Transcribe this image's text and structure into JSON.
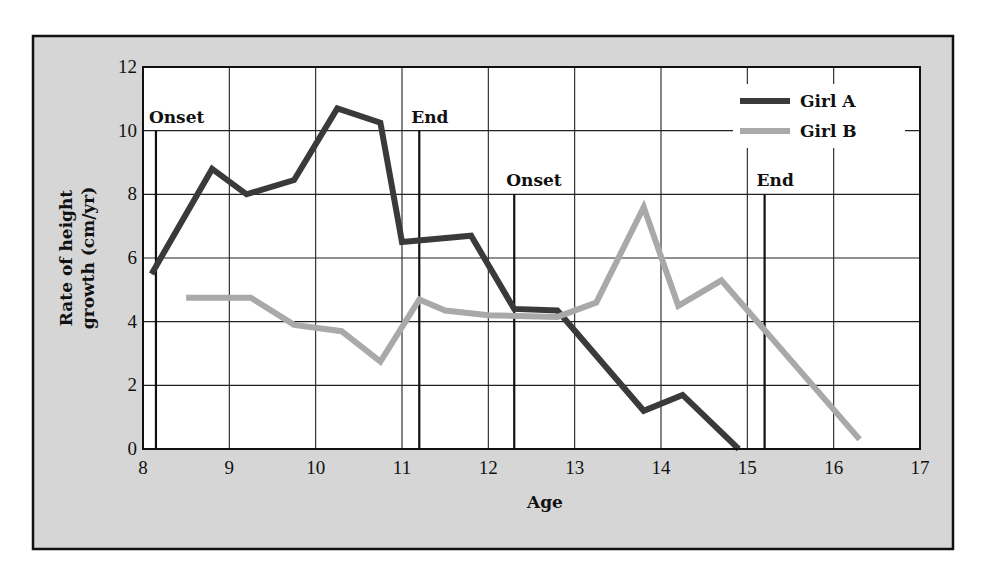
{
  "colors": {
    "page_background": "#ffffff",
    "frame_fill": "#d6d6d6",
    "frame_border": "#111111",
    "plot_background": "#ffffff",
    "grid": "#222222",
    "girl_a": "#3a3a3a",
    "girl_b": "#a9a9a9"
  },
  "chart_data": {
    "type": "line",
    "title": "",
    "xlabel": "Age",
    "ylabel_lines": [
      "Rate of height",
      "growth (cm/yr)"
    ],
    "ylabel": "Rate of height growth (cm/yr)",
    "xlim": [
      8,
      17
    ],
    "ylim": [
      0,
      12
    ],
    "xticks": [
      8,
      9,
      10,
      11,
      12,
      13,
      14,
      15,
      16,
      17
    ],
    "yticks": [
      0,
      2,
      4,
      6,
      8,
      10,
      12
    ],
    "grid": true,
    "legend_position": "top-right",
    "series": [
      {
        "name": "Girl A",
        "color": "#3a3a3a",
        "points": [
          [
            8.1,
            5.5
          ],
          [
            8.8,
            8.8
          ],
          [
            9.2,
            8.0
          ],
          [
            9.75,
            8.45
          ],
          [
            10.25,
            10.7
          ],
          [
            10.75,
            10.25
          ],
          [
            11.0,
            6.5
          ],
          [
            11.8,
            6.7
          ],
          [
            12.3,
            4.4
          ],
          [
            12.8,
            4.35
          ],
          [
            13.8,
            1.2
          ],
          [
            14.25,
            1.7
          ],
          [
            14.9,
            0.0
          ]
        ]
      },
      {
        "name": "Girl B",
        "color": "#a9a9a9",
        "points": [
          [
            8.5,
            4.75
          ],
          [
            9.25,
            4.75
          ],
          [
            9.75,
            3.9
          ],
          [
            10.3,
            3.7
          ],
          [
            10.75,
            2.75
          ],
          [
            11.2,
            4.7
          ],
          [
            11.5,
            4.35
          ],
          [
            12.0,
            4.2
          ],
          [
            12.8,
            4.15
          ],
          [
            13.25,
            4.6
          ],
          [
            13.8,
            7.6
          ],
          [
            14.2,
            4.5
          ],
          [
            14.7,
            5.3
          ],
          [
            16.3,
            0.3
          ]
        ]
      }
    ],
    "annotations": [
      {
        "label": "Onset",
        "x": 8.15,
        "y_top": 10,
        "series": "Girl A"
      },
      {
        "label": "End",
        "x": 11.2,
        "y_top": 10,
        "series": "Girl A"
      },
      {
        "label": "Onset",
        "x": 12.3,
        "y_top": 8,
        "series": "Girl B"
      },
      {
        "label": "End",
        "x": 15.2,
        "y_top": 8,
        "series": "Girl B"
      }
    ]
  }
}
